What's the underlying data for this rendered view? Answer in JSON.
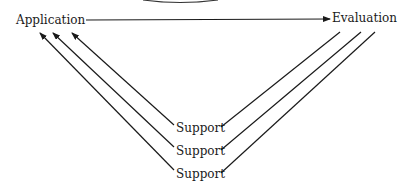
{
  "diagram": {
    "nodes": {
      "application": "Application",
      "evaluation": "Evaluation",
      "support": [
        "Support",
        "Support",
        "Support"
      ]
    },
    "edges": [
      {
        "from": "Application",
        "to": "Evaluation",
        "arrow": "head-at-target"
      },
      {
        "from": "Support 1",
        "to": "Application",
        "arrow": "head-at-target"
      },
      {
        "from": "Support 2",
        "to": "Application",
        "arrow": "head-at-target"
      },
      {
        "from": "Support 3",
        "to": "Application",
        "arrow": "head-at-target"
      },
      {
        "from": "Support 1",
        "to": "Evaluation",
        "arrow": "none"
      },
      {
        "from": "Support 2",
        "to": "Evaluation",
        "arrow": "none"
      },
      {
        "from": "Support 3",
        "to": "Evaluation",
        "arrow": "none"
      }
    ],
    "colors": {
      "ink": "#1a1a1a",
      "background": "#ffffff"
    }
  }
}
